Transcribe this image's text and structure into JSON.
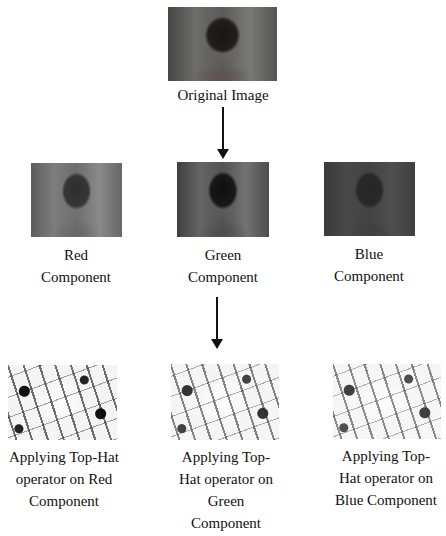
{
  "original": {
    "label": "Original Image"
  },
  "components": [
    {
      "line1": "Red",
      "line2": "Component"
    },
    {
      "line1": "Green",
      "line2": "Component"
    },
    {
      "line1": "Blue",
      "line2": "Component"
    }
  ],
  "tophat": [
    {
      "lines": [
        "Applying Top-Hat",
        "operator on Red",
        "Component"
      ]
    },
    {
      "lines": [
        "Applying Top-",
        "Hat operator on",
        "Green",
        "Component"
      ]
    },
    {
      "lines": [
        "Applying Top-",
        "Hat operator on",
        "Blue Component"
      ]
    }
  ],
  "arrows": [
    {
      "from": "Original Image",
      "to": "Green Component"
    },
    {
      "from": "Green Component",
      "to": "Applying Top-Hat operator on Green Component"
    }
  ]
}
